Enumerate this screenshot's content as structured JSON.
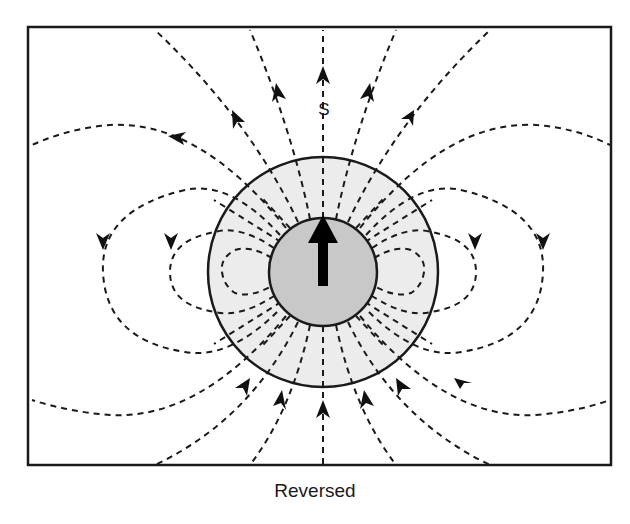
{
  "figure": {
    "caption": "Reversed",
    "pole_label": "S",
    "colors": {
      "frame": "#1a1a1a",
      "field_line": "#1a1a1a",
      "outer_sphere_fill": "#ececec",
      "inner_core_fill": "#c8c8c8",
      "arrow": "#000000",
      "background": "#ffffff"
    },
    "elements": {
      "outer_sphere": {
        "cx": 323,
        "cy": 272,
        "r": 115
      },
      "inner_core": {
        "cx": 323,
        "cy": 272,
        "r": 54
      },
      "core_arrow_direction": "up"
    }
  }
}
